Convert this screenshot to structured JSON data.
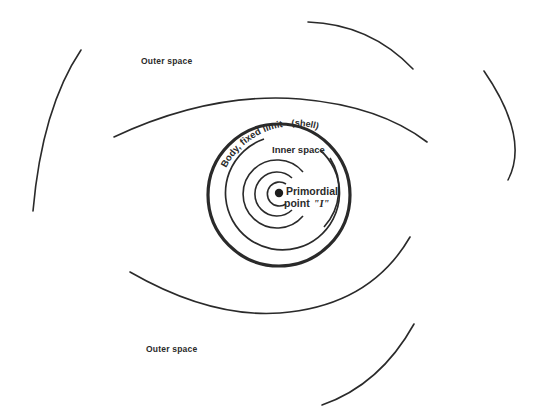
{
  "diagram": {
    "labels": {
      "outer_space_top": "Outer space",
      "outer_space_bottom": "Outer space",
      "body_limit": "Body, fixed limit",
      "shell": "(shell)",
      "inner_space": "Inner space",
      "primordial_line1": "Primordial",
      "primordial_line2": "point",
      "primordial_symbol": "\"I\""
    },
    "colors": {
      "stroke": "#2a2a2a",
      "background": "#ffffff"
    },
    "center": {
      "x": 279,
      "y": 193
    },
    "shell_radius": 70,
    "inner_radius": 55
  }
}
